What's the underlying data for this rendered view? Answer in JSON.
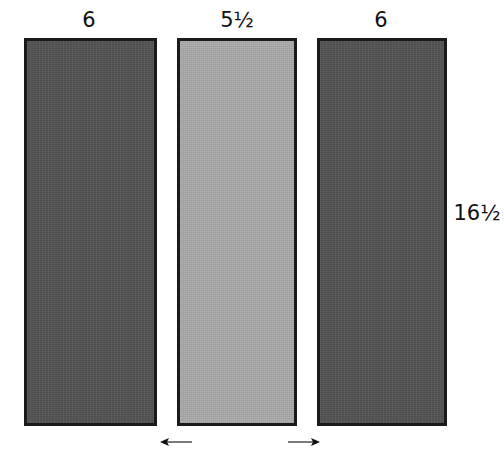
{
  "diagram": {
    "panels": [
      {
        "id": "left",
        "width_label": "6",
        "shade": "dark",
        "color": "#555555"
      },
      {
        "id": "middle",
        "width_label": "5½",
        "shade": "light",
        "color": "#a9a9a9"
      },
      {
        "id": "right",
        "width_label": "6",
        "shade": "dark",
        "color": "#555555"
      }
    ],
    "height_label": "16½",
    "arrows": [
      {
        "id": "left-arrow",
        "direction": "left"
      },
      {
        "id": "right-arrow",
        "direction": "right"
      }
    ],
    "border_color": "#1a1a1a"
  }
}
